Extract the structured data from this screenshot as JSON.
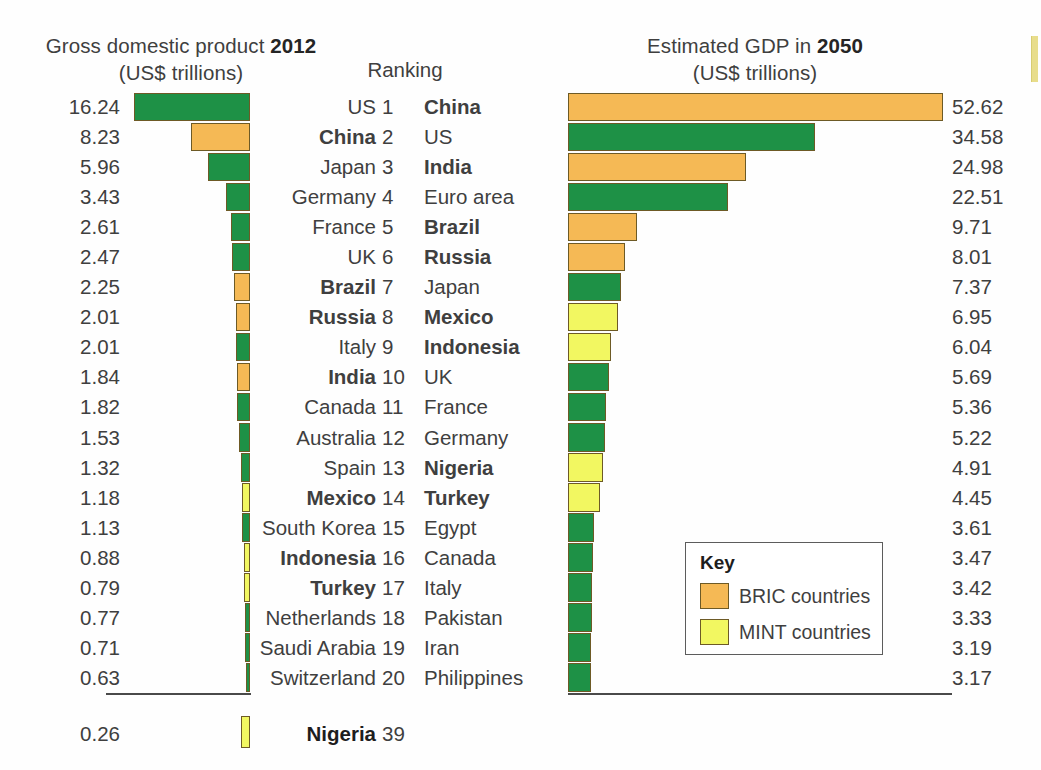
{
  "figure": {
    "left_title_prefix": "Gross domestic product ",
    "left_title_year": "2012",
    "left_subtitle": "(US$ trillions)",
    "right_title_prefix": "Estimated GDP in ",
    "right_title_year": "2050",
    "right_subtitle": "(US$ trillions)",
    "ranking_header": "Ranking"
  },
  "key": {
    "title": "Key",
    "entries": [
      {
        "label": "BRIC countries",
        "color": "#F5B955",
        "swatch_name": "bric-swatch"
      },
      {
        "label": "MINT countries",
        "color": "#F2F761",
        "swatch_name": "mint-swatch"
      }
    ]
  },
  "colors": {
    "green": "#1E9146",
    "orange": "#F5B955",
    "yellow": "#F2F761",
    "bar_outline": "#6D5A26",
    "axis": "#4A4A4A",
    "text": "#3F3F3F",
    "text_bold": "#1D1D1D"
  },
  "extra_row": {
    "value": "0.26",
    "country": "Nigeria",
    "rank": "39",
    "group": "MINT",
    "bold": true,
    "gdp_2012": 0.26
  },
  "chart_data": {
    "type": "bar",
    "orientation": "horizontal",
    "grid": false,
    "legend_position": "inside-bottom-right",
    "scale_px_per_trillion": 7.13,
    "panels": [
      {
        "name": "gdp-2012",
        "title": "Gross domestic product 2012",
        "subtitle": "(US$ trillions)",
        "ylabel": "",
        "xlabel": "US$ trillions",
        "direction": "right-to-left",
        "xlim": [
          0,
          53
        ],
        "categories": [
          "US",
          "China",
          "Japan",
          "Germany",
          "France",
          "UK",
          "Brazil",
          "Russia",
          "Italy",
          "India",
          "Canada",
          "Australia",
          "Spain",
          "Mexico",
          "South Korea",
          "Indonesia",
          "Turkey",
          "Netherlands",
          "Saudi Arabia",
          "Switzerland"
        ],
        "values": [
          16.24,
          8.23,
          5.96,
          3.43,
          2.61,
          2.47,
          2.25,
          2.01,
          2.01,
          1.84,
          1.82,
          1.53,
          1.32,
          1.18,
          1.13,
          0.88,
          0.79,
          0.77,
          0.71,
          0.63
        ],
        "value_labels": [
          "16.24",
          "8.23",
          "5.96",
          "3.43",
          "2.61",
          "2.47",
          "2.25",
          "2.01",
          "2.01",
          "1.84",
          "1.82",
          "1.53",
          "1.32",
          "1.18",
          "1.13",
          "0.88",
          "0.79",
          "0.77",
          "0.71",
          "0.63"
        ],
        "groups": [
          "other",
          "BRIC",
          "other",
          "other",
          "other",
          "other",
          "BRIC",
          "BRIC",
          "other",
          "BRIC",
          "other",
          "other",
          "other",
          "MINT",
          "other",
          "MINT",
          "MINT",
          "other",
          "other",
          "other"
        ]
      },
      {
        "name": "gdp-2050",
        "title": "Estimated GDP in 2050",
        "subtitle": "(US$ trillions)",
        "ylabel": "",
        "xlabel": "US$ trillions",
        "direction": "left-to-right",
        "xlim": [
          0,
          53
        ],
        "categories": [
          "China",
          "US",
          "India",
          "Euro area",
          "Brazil",
          "Russia",
          "Japan",
          "Mexico",
          "Indonesia",
          "UK",
          "France",
          "Germany",
          "Nigeria",
          "Turkey",
          "Egypt",
          "Canada",
          "Italy",
          "Pakistan",
          "Iran",
          "Philippines"
        ],
        "values": [
          52.62,
          34.58,
          24.98,
          22.51,
          9.71,
          8.01,
          7.37,
          6.95,
          6.04,
          5.69,
          5.36,
          5.22,
          4.91,
          4.45,
          3.61,
          3.47,
          3.42,
          3.33,
          3.19,
          3.17
        ],
        "value_labels": [
          "52.62",
          "34.58",
          "24.98",
          "22.51",
          "9.71",
          "8.01",
          "7.37",
          "6.95",
          "6.04",
          "5.69",
          "5.36",
          "5.22",
          "4.91",
          "4.45",
          "3.61",
          "3.47",
          "3.42",
          "3.33",
          "3.19",
          "3.17"
        ],
        "groups": [
          "BRIC",
          "other",
          "BRIC",
          "other",
          "BRIC",
          "BRIC",
          "other",
          "MINT",
          "MINT",
          "other",
          "other",
          "other",
          "MINT",
          "MINT",
          "other",
          "other",
          "other",
          "other",
          "other",
          "other"
        ]
      }
    ],
    "ranks": [
      "1",
      "2",
      "3",
      "4",
      "5",
      "6",
      "7",
      "8",
      "9",
      "10",
      "11",
      "12",
      "13",
      "14",
      "15",
      "16",
      "17",
      "18",
      "19",
      "20"
    ]
  }
}
